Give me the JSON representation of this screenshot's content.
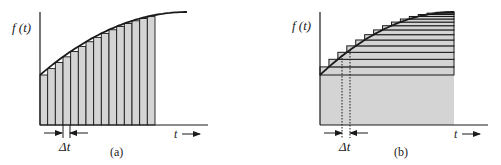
{
  "figure": {
    "panels": [
      {
        "id": "a",
        "caption": "(a)",
        "y_label": "f (t)",
        "x_label": "t",
        "delta_label": "Δt",
        "approximation": "vertical rectangular strips of width Δt under f(t)",
        "strip_count": 15
      },
      {
        "id": "b",
        "caption": "(b)",
        "y_label": "f (t)",
        "x_label": "t",
        "delta_label": "Δt",
        "approximation": "horizontal strips stacked under f(t), with Δt marked by dotted lines",
        "strip_count": 15
      }
    ],
    "colors": {
      "line": "#1a1a1a",
      "fill": "#d4d4d4",
      "background": "#ffffff"
    }
  }
}
